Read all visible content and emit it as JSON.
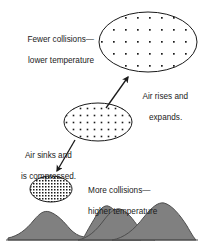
{
  "figure": {
    "background_color": "#ffffff",
    "line_color": "#1a1a1a",
    "mountain_fill": "#808080",
    "mountain_stroke": "#4d4d4d",
    "text_color": "#1a1a1a"
  },
  "labels": {
    "fewer_collisions_line1": "Fewer collisions—",
    "fewer_collisions_line2": "lower temperature",
    "air_rises_line1": "Air rises and",
    "air_rises_line2": "expands.",
    "air_sinks_line1": "Air sinks and",
    "air_sinks_line2": "is compressed.",
    "more_collisions_line1": "More collisions—",
    "more_collisions_line2": "higher temperature"
  },
  "parcels": {
    "top": {
      "name": "expanded-air-parcel",
      "density": "sparse",
      "cx": 148,
      "cy": 42,
      "rx": 49,
      "ry": 30,
      "dot_spacing": 12
    },
    "middle": {
      "name": "intermediate-air-parcel",
      "density": "medium",
      "cx": 98,
      "cy": 122,
      "rx": 34,
      "ry": 19,
      "dot_spacing": 7
    },
    "bottom": {
      "name": "compressed-air-parcel",
      "density": "dense",
      "cx": 51,
      "cy": 189,
      "rx": 21,
      "ry": 13,
      "dot_spacing": 3
    }
  },
  "arrows": {
    "rising": {
      "x1": 106,
      "y1": 108,
      "x2": 128,
      "y2": 76
    },
    "sinking": {
      "x1": 75,
      "y1": 140,
      "x2": 57,
      "y2": 172
    }
  },
  "ground": {
    "baseline_y": 240,
    "peaks": [
      {
        "name": "left-mountain",
        "apex_x": 45,
        "apex_y": 212
      },
      {
        "name": "center-mountain",
        "apex_x": 103,
        "apex_y": 206
      },
      {
        "name": "right-mountain",
        "apex_x": 160,
        "apex_y": 203
      }
    ]
  }
}
